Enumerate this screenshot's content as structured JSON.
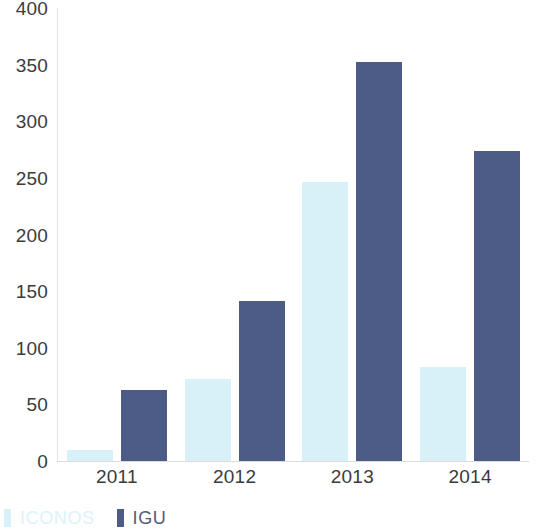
{
  "chart_data": {
    "type": "bar",
    "title": "",
    "subtitle": "",
    "xlabel": "",
    "ylabel": "",
    "categories": [
      "2011",
      "2012",
      "2013",
      "2014"
    ],
    "series": [
      {
        "name": "ICONOS",
        "color": "#d8f1f9",
        "values": [
          10,
          72,
          246,
          83
        ]
      },
      {
        "name": "IGU",
        "color": "#4c5c87",
        "values": [
          63,
          141,
          352,
          274
        ]
      }
    ],
    "ylim": [
      0,
      400
    ],
    "y_ticks": [
      0,
      50,
      100,
      150,
      200,
      250,
      300,
      350,
      400
    ],
    "y_tick_labels": [
      "0",
      "50",
      "100",
      "150",
      "200",
      "250",
      "300",
      "350",
      "400"
    ],
    "grid": false,
    "legend_position": "bottom-left",
    "annotations": []
  },
  "axes": {
    "y_axis_color": "#e2e2e2",
    "x_axis_color": "#dcdcdc",
    "tick_text_color": "#3b3b3b"
  },
  "legend": {
    "items": [
      {
        "label": "ICONOS",
        "color": "#d8f1f9",
        "text_color": "#ddf2f9"
      },
      {
        "label": "IGU",
        "color": "#4c5c87",
        "text_color": "#4f5b78"
      }
    ]
  },
  "background": "#ffffff"
}
